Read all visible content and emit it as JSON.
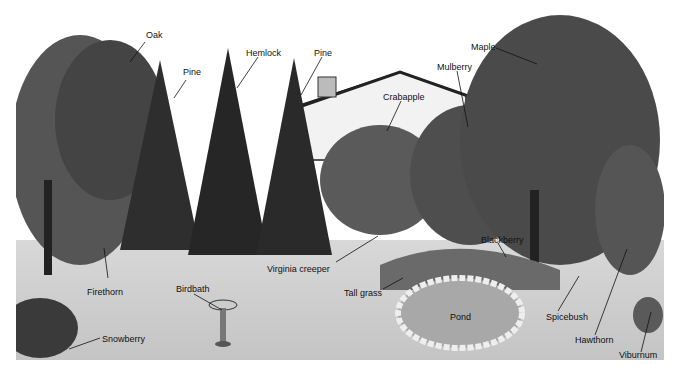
{
  "diagram": {
    "labels": [
      {
        "id": "oak",
        "text": "Oak",
        "x": 146,
        "y": 35
      },
      {
        "id": "pine-1",
        "text": "Pine",
        "x": 182,
        "y": 68
      },
      {
        "id": "hemlock",
        "text": "Hemlock",
        "x": 245,
        "y": 49
      },
      {
        "id": "pine-2",
        "text": "Pine",
        "x": 314,
        "y": 49
      },
      {
        "id": "maple",
        "text": "Maple",
        "x": 471,
        "y": 43
      },
      {
        "id": "mulberry",
        "text": "Mulberry",
        "x": 437,
        "y": 63
      },
      {
        "id": "crabapple",
        "text": "Crabapple",
        "x": 383,
        "y": 93
      },
      {
        "id": "virginia-creeper",
        "text": "Virginia creeper",
        "x": 266,
        "y": 265
      },
      {
        "id": "firethorn",
        "text": "Firethorn",
        "x": 87,
        "y": 288
      },
      {
        "id": "birdbath",
        "text": "Birdbath",
        "x": 176,
        "y": 285
      },
      {
        "id": "tall-grass",
        "text": "Tall grass",
        "x": 343,
        "y": 289
      },
      {
        "id": "blackberry",
        "text": "Blackberry",
        "x": 481,
        "y": 236
      },
      {
        "id": "pond",
        "text": "Pond",
        "x": 450,
        "y": 313
      },
      {
        "id": "spicebush",
        "text": "Spicebush",
        "x": 546,
        "y": 313
      },
      {
        "id": "hawthorn",
        "text": "Hawthorn",
        "x": 575,
        "y": 336
      },
      {
        "id": "snowberry",
        "text": "Snowberry",
        "x": 102,
        "y": 335
      },
      {
        "id": "viburnum",
        "text": "Viburnum",
        "x": 619,
        "y": 351
      }
    ]
  }
}
